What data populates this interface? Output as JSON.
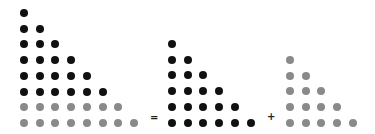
{
  "diagram": {
    "colors": {
      "dark": "#111111",
      "light": "#8a8a8a"
    },
    "spacing": 15.7,
    "operators": [
      {
        "symbol": "=",
        "x": 153,
        "y": 118
      },
      {
        "symbol": "+",
        "x": 270,
        "y": 117
      }
    ],
    "triangles": [
      {
        "name": "left-triangle",
        "origin": {
          "x": 24,
          "y": 13
        },
        "rows": [
          {
            "count": 1,
            "color": "dark"
          },
          {
            "count": 2,
            "color": "dark"
          },
          {
            "count": 3,
            "color": "dark"
          },
          {
            "count": 4,
            "color": "dark"
          },
          {
            "count": 5,
            "color": "dark"
          },
          {
            "count": 6,
            "color": "dark"
          },
          {
            "count": 7,
            "color": "light"
          },
          {
            "count": 8,
            "color": "light"
          }
        ]
      },
      {
        "name": "middle-triangle",
        "origin": {
          "x": 172,
          "y": 44
        },
        "rows": [
          {
            "count": 1,
            "color": "dark"
          },
          {
            "count": 2,
            "color": "dark"
          },
          {
            "count": 3,
            "color": "dark"
          },
          {
            "count": 4,
            "color": "dark"
          },
          {
            "count": 5,
            "color": "dark"
          },
          {
            "count": 6,
            "color": "dark"
          }
        ]
      },
      {
        "name": "right-triangle",
        "origin": {
          "x": 290,
          "y": 60
        },
        "rows": [
          {
            "count": 1,
            "color": "light"
          },
          {
            "count": 2,
            "color": "light"
          },
          {
            "count": 3,
            "color": "light"
          },
          {
            "count": 4,
            "color": "light"
          },
          {
            "count": 5,
            "color": "light"
          }
        ]
      }
    ]
  }
}
